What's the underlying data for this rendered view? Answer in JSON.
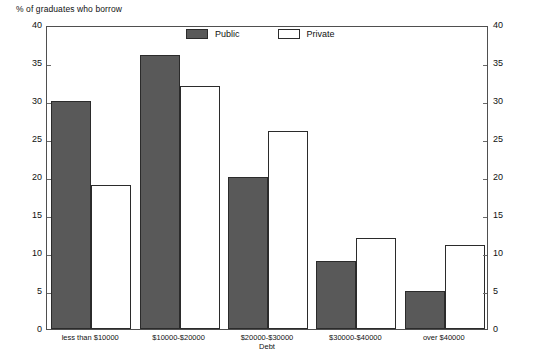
{
  "chart_data": {
    "type": "bar",
    "title": "",
    "xlabel": "Debt",
    "ylabel": "% of graduates who borrow",
    "categories": [
      "less than $10000",
      "$10000-$20000",
      "$20000-$30000",
      "$30000-$40000",
      "over $40000"
    ],
    "series": [
      {
        "name": "Public",
        "color": "#595959",
        "values": [
          30,
          36,
          20,
          9,
          5
        ]
      },
      {
        "name": "Private",
        "color": "#ffffff",
        "values": [
          19,
          32,
          26,
          12,
          11
        ]
      }
    ],
    "ylim": [
      0,
      40
    ],
    "yticks": [
      0,
      5,
      10,
      15,
      20,
      25,
      30,
      35,
      40
    ],
    "ytick_labels": [
      "0",
      "5",
      "10",
      "15",
      "20",
      "25",
      "30",
      "35",
      "40"
    ],
    "right_axis": true,
    "right_ytick_labels": [
      "0",
      "5",
      "10",
      "15",
      "20",
      "25",
      "30",
      "35",
      "40"
    ],
    "grid": false,
    "legend_position": "top-center",
    "legend_entries": [
      "Public",
      "Private"
    ]
  },
  "axes": {
    "y_caption": "% of graduates who borrow",
    "x_caption": "Debt"
  },
  "legend": {
    "entries": [
      {
        "label": "Public"
      },
      {
        "label": "Private"
      }
    ]
  },
  "colors": {
    "public_fill": "#595959",
    "private_fill": "#ffffff",
    "bar_stroke": "#2b2b2b",
    "frame": "#4f4f4f",
    "text": "#111111"
  }
}
